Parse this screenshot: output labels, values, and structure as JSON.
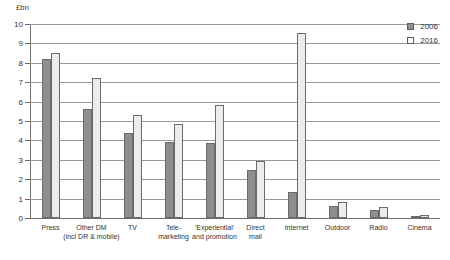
{
  "chart_data": {
    "type": "bar",
    "title": "",
    "subtitle": "",
    "xlabel": "",
    "ylabel": "£bn",
    "ylim": [
      0,
      10
    ],
    "ytick_step": 1,
    "yticks": [
      "0",
      "1",
      "2",
      "3",
      "4",
      "5",
      "6",
      "7",
      "8",
      "9",
      "10"
    ],
    "grid": true,
    "legend_position": "top-right",
    "categories": [
      "Press",
      "Other DM\n(incl DR & mobile)",
      "TV",
      "Tele-\nmarketing",
      "'Experiential'\nand promotion",
      "Direct\nmail",
      "Internet",
      "Outdoor",
      "Radio",
      "Cinema"
    ],
    "category_lines": [
      [
        "Press"
      ],
      [
        "Other DM",
        "(incl DR & mobile)"
      ],
      [
        "TV"
      ],
      [
        "Tele-",
        "marketing"
      ],
      [
        "'Experiential'",
        "and promotion"
      ],
      [
        "Direct",
        "mail"
      ],
      [
        "Internet"
      ],
      [
        "Outdoor"
      ],
      [
        "Radio"
      ],
      [
        "Cinema"
      ]
    ],
    "series": [
      {
        "name": "2006",
        "color": "#8e8e8e",
        "values": [
          8.2,
          5.6,
          4.4,
          3.9,
          3.85,
          2.5,
          1.35,
          0.6,
          0.4,
          0.1
        ]
      },
      {
        "name": "2016",
        "color": "#ececec",
        "values": [
          8.5,
          7.2,
          5.3,
          4.85,
          5.85,
          2.95,
          9.55,
          0.8,
          0.55,
          0.15
        ]
      }
    ]
  },
  "legend": {
    "items": [
      {
        "label": "2006"
      },
      {
        "label": "2016"
      }
    ]
  },
  "axis": {
    "unit_label": "£bn"
  }
}
